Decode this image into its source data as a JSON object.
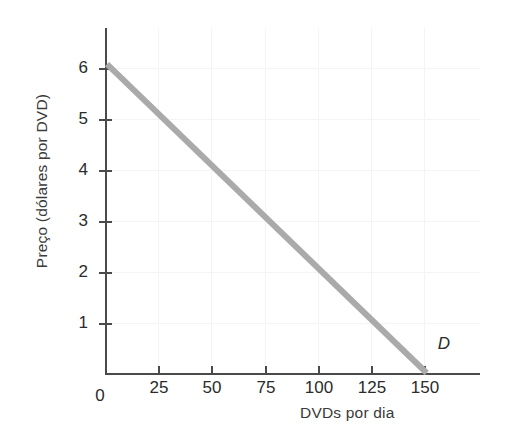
{
  "chart_data": {
    "type": "line",
    "title": "",
    "subtitle": "",
    "xlabel": "DVDs por dia",
    "ylabel": "Preço (dólares por DVD)",
    "xlim": [
      0,
      175
    ],
    "ylim": [
      0,
      6.7
    ],
    "xticks": [
      0,
      25,
      50,
      75,
      100,
      125,
      150
    ],
    "xticklabels": [
      "0",
      "25",
      "50",
      "75",
      "100",
      "125",
      "150"
    ],
    "yticks": [
      1,
      2,
      3,
      4,
      5,
      6
    ],
    "yticklabels": [
      "1",
      "2",
      "3",
      "4",
      "5",
      "6"
    ],
    "grid": true,
    "legend": "none",
    "series": [
      {
        "name": "D",
        "label": "D",
        "color": "#aaaaaa",
        "linewidth": 6,
        "annotation": "D",
        "x": [
          0,
          25,
          50,
          75,
          100,
          125,
          150
        ],
        "y": [
          6,
          5,
          4,
          3,
          2,
          1,
          0
        ]
      }
    ],
    "annotations": [
      {
        "text": "D",
        "x": 157,
        "y": 0.55,
        "style": "italic"
      }
    ]
  },
  "axes": {
    "x_tick_labels": [
      "0",
      "25",
      "50",
      "75",
      "100",
      "125",
      "150"
    ],
    "y_tick_labels": [
      "6",
      "5",
      "4",
      "3",
      "2",
      "1"
    ],
    "x_axis_title": "DVDs por dia",
    "y_axis_title": "Preço (dólares por DVD)"
  },
  "colors": {
    "background": "#ffffff",
    "axis": "#4a4a4a",
    "grid": "#f4f4f4",
    "demand_line": "#aaaaaa",
    "text": "#2b2b2b"
  }
}
